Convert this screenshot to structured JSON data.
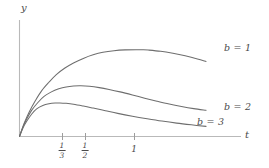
{
  "figure": {
    "axis_labels": {
      "x": "t",
      "y": "y"
    },
    "x_ticks": [
      {
        "value": 0.3333,
        "display_num": "1",
        "display_den": "3",
        "kind": "fraction",
        "px": 62
      },
      {
        "value": 0.5,
        "display_num": "1",
        "display_den": "2",
        "kind": "fraction",
        "px": 85
      },
      {
        "value": 1.0,
        "display": "1",
        "kind": "whole",
        "px": 134
      }
    ],
    "series_labels": [
      {
        "text": "b = 1"
      },
      {
        "text": "b = 2"
      },
      {
        "text": "b = 3"
      }
    ],
    "colors": {
      "curve": "#6e6e6e",
      "axis": "#b9b9b9",
      "text": "#4a4a4a",
      "background": "#ffffff"
    }
  },
  "chart_data": {
    "type": "line",
    "title": "",
    "xlabel": "t",
    "ylabel": "y",
    "xlim": [
      0,
      1.65
    ],
    "ylim": [
      0,
      1.05
    ],
    "grid": false,
    "legend": "inline-right",
    "xticks": [
      0.3333,
      0.5,
      1.0
    ],
    "xticklabels": [
      "1/3",
      "1/2",
      "1"
    ],
    "yticks": [],
    "yticklabels": [],
    "series": [
      {
        "name": "b = 1",
        "label": "b = 1",
        "peak_t": 1.0,
        "peak_y": 0.855,
        "x": [
          0,
          0.04,
          0.08,
          0.13,
          0.18,
          0.24,
          0.3,
          0.37,
          0.44,
          0.52,
          0.6,
          0.68,
          0.77,
          0.86,
          0.95,
          1.0,
          1.05,
          1.15,
          1.25,
          1.35,
          1.45,
          1.52
        ],
        "y": [
          0,
          0.135,
          0.245,
          0.355,
          0.45,
          0.535,
          0.61,
          0.675,
          0.725,
          0.77,
          0.805,
          0.83,
          0.846,
          0.854,
          0.856,
          0.855,
          0.852,
          0.84,
          0.82,
          0.795,
          0.765,
          0.74
        ]
      },
      {
        "name": "b = 2",
        "label": "b = 2",
        "peak_t": 0.5,
        "peak_y": 0.5,
        "x": [
          0,
          0.03,
          0.06,
          0.1,
          0.15,
          0.2,
          0.26,
          0.32,
          0.38,
          0.44,
          0.5,
          0.57,
          0.65,
          0.73,
          0.82,
          0.92,
          1.02,
          1.12,
          1.22,
          1.32,
          1.42,
          1.52
        ],
        "y": [
          0,
          0.1,
          0.175,
          0.26,
          0.335,
          0.395,
          0.44,
          0.47,
          0.489,
          0.498,
          0.5,
          0.495,
          0.482,
          0.464,
          0.44,
          0.41,
          0.378,
          0.348,
          0.32,
          0.296,
          0.275,
          0.258
        ]
      },
      {
        "name": "b = 3",
        "label": "b = 3",
        "peak_t": 0.3333,
        "peak_y": 0.33,
        "x": [
          0,
          0.03,
          0.06,
          0.1,
          0.14,
          0.19,
          0.24,
          0.29,
          0.33,
          0.38,
          0.44,
          0.52,
          0.6,
          0.7,
          0.8,
          0.92,
          1.04,
          1.16,
          1.28,
          1.4,
          1.52
        ],
        "y": [
          0,
          0.088,
          0.152,
          0.222,
          0.272,
          0.305,
          0.322,
          0.33,
          0.331,
          0.327,
          0.318,
          0.3,
          0.28,
          0.254,
          0.228,
          0.2,
          0.175,
          0.152,
          0.132,
          0.115,
          0.1
        ]
      }
    ]
  }
}
